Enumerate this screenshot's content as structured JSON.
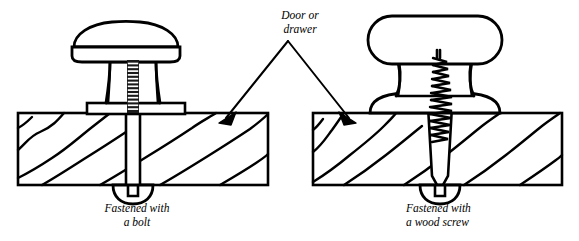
{
  "figure": {
    "background_color": "#ffffff",
    "ink_color": "#000000",
    "width": 579,
    "height": 241
  },
  "annotation": {
    "door_label": "Door or\ndrawer",
    "door_label_line1": "Door or",
    "door_label_line2": "drawer",
    "arrow_apex_x": 288,
    "arrow_apex_y": 40,
    "arrow_left_tip_x": 222,
    "arrow_left_tip_y": 120,
    "arrow_right_tip_x": 352,
    "arrow_right_tip_y": 120
  },
  "left_assembly": {
    "caption": "Fastened with\na bolt",
    "caption_line1": "Fastened with",
    "caption_line2": "a bolt",
    "fastener_type": "bolt",
    "knob_style": "mushroom cap with waisted stem",
    "has_flange_plate": true,
    "thread_rungs": 14,
    "panel": {
      "x": 18,
      "y": 113,
      "width": 250,
      "height": 72
    },
    "shaft": {
      "x": 126,
      "width": 14,
      "top": 103,
      "bottom": 185
    }
  },
  "right_assembly": {
    "caption": "Fastened with\na wood screw",
    "caption_line1": "Fastened with",
    "caption_line2": "a wood screw",
    "fastener_type": "wood screw",
    "knob_style": "rounded rectangular cap with hourglass neck",
    "has_flange_plate": false,
    "thread_turns": 11,
    "panel": {
      "x": 313,
      "y": 113,
      "width": 249,
      "height": 72
    },
    "shaft": {
      "x": 433,
      "width": 14,
      "top": 96,
      "bottom": 185
    }
  },
  "wood_grain": {
    "style": "diagonal wavy cross-section lines",
    "direction": "lower-left to upper-right"
  },
  "anchors": {
    "style": "rounded cap nut with notch",
    "left_center_x": 133,
    "right_center_x": 440,
    "top_y": 185
  }
}
